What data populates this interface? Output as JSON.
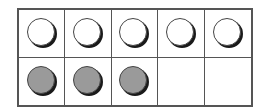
{
  "ten_frame": {
    "columns": 5,
    "rows": 2,
    "cells": [
      {
        "row": 1,
        "col": 1,
        "counter": "white"
      },
      {
        "row": 1,
        "col": 2,
        "counter": "white"
      },
      {
        "row": 1,
        "col": 3,
        "counter": "white"
      },
      {
        "row": 1,
        "col": 4,
        "counter": "white"
      },
      {
        "row": 1,
        "col": 5,
        "counter": "white"
      },
      {
        "row": 2,
        "col": 1,
        "counter": "gray"
      },
      {
        "row": 2,
        "col": 2,
        "counter": "gray"
      },
      {
        "row": 2,
        "col": 3,
        "counter": "gray"
      },
      {
        "row": 2,
        "col": 4,
        "counter": "empty"
      },
      {
        "row": 2,
        "col": 5,
        "counter": "empty"
      }
    ],
    "counts": {
      "white": 5,
      "gray": 3,
      "empty": 2
    },
    "colors": {
      "border": "#555555",
      "white_counter": "#ffffff",
      "gray_counter": "#9a9a9a",
      "shadow": "#1a1a1a"
    }
  }
}
